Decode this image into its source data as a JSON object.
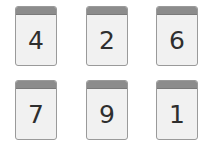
{
  "cards": [
    {
      "digit": "4",
      "left": 15,
      "top": 6
    },
    {
      "digit": "2",
      "left": 86,
      "top": 6
    },
    {
      "digit": "6",
      "left": 156,
      "top": 6
    },
    {
      "digit": "7",
      "left": 15,
      "top": 80
    },
    {
      "digit": "9",
      "left": 86,
      "top": 80
    },
    {
      "digit": "1",
      "left": 156,
      "top": 80
    }
  ],
  "colors": {
    "card_body": "#f1f1f1",
    "card_header": "#8c8c8c",
    "card_border": "#9a9a9a",
    "digit": "#2e2e2e"
  }
}
